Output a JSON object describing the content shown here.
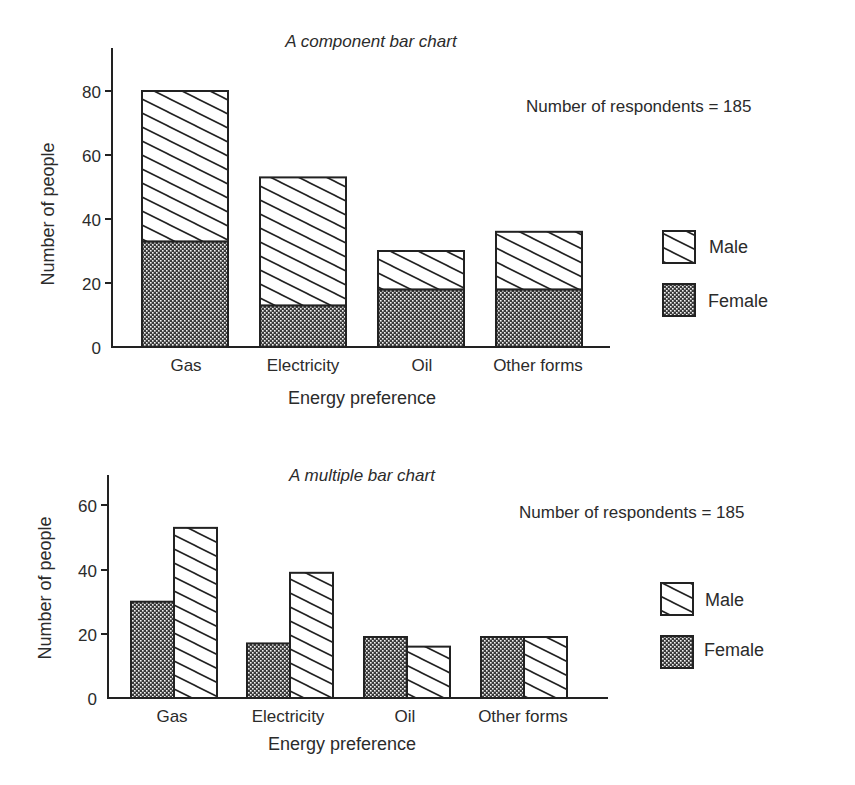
{
  "chart_data": [
    {
      "type": "bar",
      "stacked": true,
      "title": "A component bar chart",
      "xlabel": "Energy preference",
      "ylabel": "Number of people",
      "annotation": "Number of respondents = 185",
      "categories": [
        "Gas",
        "Electricity",
        "Oil",
        "Other forms"
      ],
      "series": [
        {
          "name": "Female",
          "values": [
            33,
            13,
            18,
            18
          ],
          "fill": "crosshatch-dots"
        },
        {
          "name": "Male",
          "values": [
            47,
            40,
            12,
            18
          ],
          "fill": "diagonal-hatch"
        }
      ],
      "totals": [
        80,
        53,
        30,
        36
      ],
      "yticks": [
        0,
        20,
        40,
        60,
        80
      ],
      "ylim": [
        0,
        92
      ],
      "grid": false,
      "legend": {
        "position": "right",
        "entries": [
          "Male",
          "Female"
        ]
      }
    },
    {
      "type": "bar",
      "stacked": false,
      "title": "A multiple bar chart",
      "xlabel": "Energy preference",
      "ylabel": "Number of people",
      "annotation": "Number of respondents = 185",
      "categories": [
        "Gas",
        "Electricity",
        "Oil",
        "Other forms"
      ],
      "series": [
        {
          "name": "Female",
          "values": [
            30,
            17,
            19,
            19
          ],
          "fill": "crosshatch-dots"
        },
        {
          "name": "Male",
          "values": [
            53,
            39,
            16,
            19
          ],
          "fill": "diagonal-hatch"
        }
      ],
      "yticks": [
        0,
        20,
        40,
        60
      ],
      "ylim": [
        0,
        69
      ],
      "grid": false,
      "legend": {
        "position": "right",
        "entries": [
          "Male",
          "Female"
        ]
      }
    }
  ],
  "top": {
    "title": "A component bar chart",
    "respondents": "Number of respondents = 185",
    "ylabel": "Number of people",
    "xlabel": "Energy preference",
    "ticks": [
      "0",
      "20",
      "40",
      "60",
      "80"
    ],
    "categories": [
      "Gas",
      "Electricity",
      "Oil",
      "Other forms"
    ],
    "legend": {
      "male": "Male",
      "female": "Female"
    }
  },
  "bottom": {
    "title": "A multiple bar chart",
    "respondents": "Number of respondents = 185",
    "ylabel": "Number of people",
    "xlabel": "Energy preference",
    "ticks": [
      "0",
      "20",
      "40",
      "60"
    ],
    "categories": [
      "Gas",
      "Electricity",
      "Oil",
      "Other forms"
    ],
    "legend": {
      "male": "Male",
      "female": "Female"
    }
  }
}
